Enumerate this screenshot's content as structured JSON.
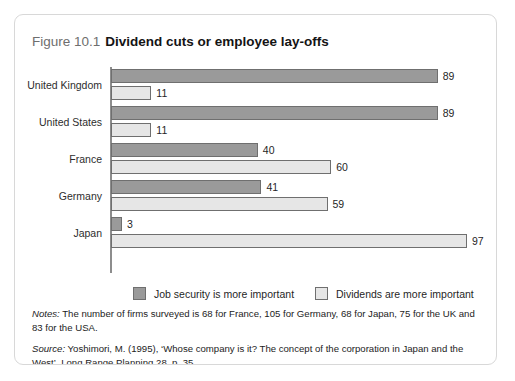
{
  "figure": {
    "number": "Figure 10.1",
    "title": "Dividend cuts or employee lay-offs"
  },
  "chart_data": {
    "type": "bar",
    "orientation": "horizontal",
    "title": "Dividend cuts or employee lay-offs",
    "xlabel": "",
    "ylabel": "",
    "xlim": [
      0,
      100
    ],
    "grid": false,
    "legend_position": "bottom",
    "categories": [
      "United Kingdom",
      "United States",
      "France",
      "Germany",
      "Japan"
    ],
    "series": [
      {
        "name": "Job security is more important",
        "color": "#9a9a9a",
        "values": [
          89,
          89,
          40,
          41,
          3
        ]
      },
      {
        "name": "Dividends are more important",
        "color": "#e6e6e6",
        "values": [
          11,
          11,
          60,
          59,
          97
        ]
      }
    ]
  },
  "legend": {
    "items": [
      {
        "label": "Job security is more important",
        "swatch": "dark"
      },
      {
        "label": "Dividends are more important",
        "swatch": "light"
      }
    ]
  },
  "footnotes": {
    "notes_label": "Notes:",
    "notes_text": " The number of firms surveyed is 68 for France, 105 for Germany, 68 for Japan, 75 for the UK and 83 for the USA.",
    "source_label": "Source:",
    "source_text": " Yoshimori, M. (1995), ‘Whose company is it? The concept of the corporation in Japan and the West’, Long Range Planning 28, p. 35"
  }
}
